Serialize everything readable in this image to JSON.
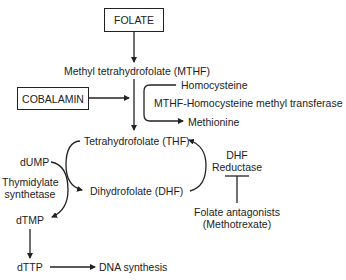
{
  "diagram": {
    "nodes": {
      "folate": "FOLATE",
      "mthf": "Methyl tetrahydrofolate (MTHF)",
      "cobalamin": "COBALAMIN",
      "homocysteine": "Homocysteine",
      "enzyme_methyltransferase": "MTHF-Homocysteine methyl transferase",
      "methionine": "Methionine",
      "thf": "Tetrahydrofolate (THF)",
      "dump": "dUMP",
      "thymidylate_line1": "Thymidylate",
      "thymidylate_line2": "synthetase",
      "dhf": "Dihydrofolate (DHF)",
      "dhf_reductase_line1": "DHF",
      "dhf_reductase_line2": "Reductase",
      "antagonists_line1": "Folate antagonists",
      "antagonists_line2": "(Methotrexate)",
      "dtmp": "dTMP",
      "dttp": "dTTP",
      "dna_synthesis": "DNA synthesis"
    },
    "edges": [
      {
        "from": "FOLATE",
        "to": "Methyl tetrahydrofolate (MTHF)"
      },
      {
        "from": "COBALAMIN",
        "to": "MTHF to THF conversion"
      },
      {
        "from": "Methyl tetrahydrofolate (MTHF)",
        "to": "Tetrahydrofolate (THF)"
      },
      {
        "from": "Homocysteine",
        "to": "Methionine",
        "label": "MTHF-Homocysteine methyl transferase"
      },
      {
        "from": "Tetrahydrofolate (THF)",
        "to": "Dihydrofolate (DHF)"
      },
      {
        "from": "Dihydrofolate (DHF)",
        "to": "Tetrahydrofolate (THF)",
        "label": "DHF Reductase"
      },
      {
        "from": "dUMP",
        "to": "dTMP",
        "label": "Thymidylate synthetase"
      },
      {
        "from": "Folate antagonists (Methotrexate)",
        "to": "DHF Reductase",
        "type": "inhibition"
      },
      {
        "from": "dTMP",
        "to": "dTTP"
      },
      {
        "from": "dTTP",
        "to": "DNA synthesis"
      }
    ]
  }
}
